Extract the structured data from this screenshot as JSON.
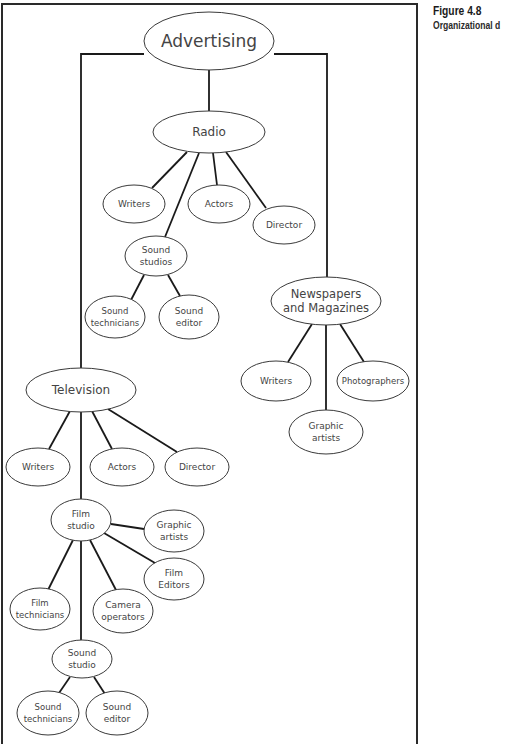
{
  "caption": {
    "title": "Figure 4.8",
    "subtitle": "Organizational d"
  },
  "diagram": {
    "frame": {
      "left": 2,
      "top": 4,
      "right": 417,
      "bottom": 744
    },
    "nodes": [
      {
        "id": "advertising",
        "lines": [
          "Advertising"
        ],
        "cx": 209,
        "cy": 41,
        "rx": 65,
        "ry": 29,
        "fs": 17
      },
      {
        "id": "radio",
        "lines": [
          "Radio"
        ],
        "cx": 209,
        "cy": 132,
        "rx": 56,
        "ry": 21,
        "fs": 12
      },
      {
        "id": "radio-writers",
        "lines": [
          "Writers"
        ],
        "cx": 134,
        "cy": 204,
        "rx": 31,
        "ry": 19,
        "fs": 9
      },
      {
        "id": "radio-actors",
        "lines": [
          "Actors"
        ],
        "cx": 219,
        "cy": 204,
        "rx": 31,
        "ry": 19,
        "fs": 9
      },
      {
        "id": "radio-director",
        "lines": [
          "Director"
        ],
        "cx": 284,
        "cy": 225,
        "rx": 31,
        "ry": 19,
        "fs": 9
      },
      {
        "id": "radio-sound-studios",
        "lines": [
          "Sound",
          "studios"
        ],
        "cx": 156,
        "cy": 256,
        "rx": 31,
        "ry": 20,
        "fs": 9
      },
      {
        "id": "radio-sound-technicians",
        "lines": [
          "Sound",
          "technicians"
        ],
        "cx": 115,
        "cy": 317,
        "rx": 30,
        "ry": 21,
        "fs": 8.5
      },
      {
        "id": "radio-sound-editor",
        "lines": [
          "Sound",
          "editor"
        ],
        "cx": 189,
        "cy": 317,
        "rx": 30,
        "ry": 22,
        "fs": 9
      },
      {
        "id": "newspapers",
        "lines": [
          "Newspapers",
          "and Magazines"
        ],
        "cx": 326,
        "cy": 301,
        "rx": 55,
        "ry": 24,
        "fs": 11.5
      },
      {
        "id": "news-writers",
        "lines": [
          "Writers"
        ],
        "cx": 276,
        "cy": 381,
        "rx": 35,
        "ry": 20,
        "fs": 9
      },
      {
        "id": "news-photographers",
        "lines": [
          "Photographers"
        ],
        "cx": 373,
        "cy": 381,
        "rx": 36,
        "ry": 20,
        "fs": 8.5
      },
      {
        "id": "news-graphic-artists",
        "lines": [
          "Graphic",
          "artists"
        ],
        "cx": 326,
        "cy": 432,
        "rx": 37,
        "ry": 22,
        "fs": 9
      },
      {
        "id": "television",
        "lines": [
          "Television"
        ],
        "cx": 81,
        "cy": 390,
        "rx": 55,
        "ry": 22,
        "fs": 12
      },
      {
        "id": "tv-writers",
        "lines": [
          "Writers"
        ],
        "cx": 38,
        "cy": 467,
        "rx": 32,
        "ry": 19,
        "fs": 9
      },
      {
        "id": "tv-actors",
        "lines": [
          "Actors"
        ],
        "cx": 122,
        "cy": 467,
        "rx": 32,
        "ry": 19,
        "fs": 9
      },
      {
        "id": "tv-director",
        "lines": [
          "Director"
        ],
        "cx": 197,
        "cy": 467,
        "rx": 32,
        "ry": 19,
        "fs": 9
      },
      {
        "id": "film-studio",
        "lines": [
          "Film",
          "studio"
        ],
        "cx": 81,
        "cy": 520,
        "rx": 30,
        "ry": 21,
        "fs": 9
      },
      {
        "id": "film-graphic-artists",
        "lines": [
          "Graphic",
          "artists"
        ],
        "cx": 174,
        "cy": 531,
        "rx": 30,
        "ry": 21,
        "fs": 9
      },
      {
        "id": "film-editors",
        "lines": [
          "Film",
          "Editors"
        ],
        "cx": 174,
        "cy": 579,
        "rx": 30,
        "ry": 21,
        "fs": 9
      },
      {
        "id": "film-technicians",
        "lines": [
          "Film",
          "technicians"
        ],
        "cx": 40,
        "cy": 609,
        "rx": 30,
        "ry": 21,
        "fs": 8.5
      },
      {
        "id": "camera-operators",
        "lines": [
          "Camera",
          "operators"
        ],
        "cx": 123,
        "cy": 611,
        "rx": 30,
        "ry": 22,
        "fs": 9
      },
      {
        "id": "tv-sound-studio",
        "lines": [
          "Sound",
          "studio"
        ],
        "cx": 82,
        "cy": 659,
        "rx": 30,
        "ry": 19,
        "fs": 9
      },
      {
        "id": "tv-sound-technicians",
        "lines": [
          "Sound",
          "technicians"
        ],
        "cx": 48,
        "cy": 713,
        "rx": 31,
        "ry": 22,
        "fs": 8.5
      },
      {
        "id": "tv-sound-editor",
        "lines": [
          "Sound",
          "editor"
        ],
        "cx": 117,
        "cy": 713,
        "rx": 31,
        "ry": 22,
        "fs": 9
      }
    ],
    "edges": [
      {
        "from": "advertising",
        "to": "radio",
        "points": [
          [
            209,
            70
          ],
          [
            209,
            111
          ]
        ]
      },
      {
        "from": "advertising",
        "to": "television",
        "points": [
          [
            144,
            54
          ],
          [
            81,
            54
          ],
          [
            81,
            368
          ]
        ]
      },
      {
        "from": "advertising",
        "to": "newspapers",
        "points": [
          [
            274,
            54
          ],
          [
            327,
            54
          ],
          [
            327,
            277
          ]
        ]
      },
      {
        "from": "radio",
        "to": "radio-writers",
        "points": [
          [
            187,
            152
          ],
          [
            152,
            188
          ]
        ]
      },
      {
        "from": "radio",
        "to": "radio-sound-studios",
        "points": [
          [
            199,
            153
          ],
          [
            165,
            237
          ]
        ]
      },
      {
        "from": "radio",
        "to": "radio-actors",
        "points": [
          [
            213,
            153
          ],
          [
            217,
            185
          ]
        ]
      },
      {
        "from": "radio",
        "to": "radio-director",
        "points": [
          [
            226,
            152
          ],
          [
            266,
            208
          ]
        ]
      },
      {
        "from": "radio-sound-studios",
        "to": "radio-sound-technicians",
        "points": [
          [
            144,
            275
          ],
          [
            131,
            300
          ]
        ]
      },
      {
        "from": "radio-sound-studios",
        "to": "radio-sound-editor",
        "points": [
          [
            168,
            275
          ],
          [
            180,
            296
          ]
        ]
      },
      {
        "from": "newspapers",
        "to": "news-writers",
        "points": [
          [
            312,
            324
          ],
          [
            288,
            362
          ]
        ]
      },
      {
        "from": "newspapers",
        "to": "news-graphic-artists",
        "points": [
          [
            326,
            325
          ],
          [
            326,
            410
          ]
        ]
      },
      {
        "from": "newspapers",
        "to": "news-photographers",
        "points": [
          [
            340,
            324
          ],
          [
            364,
            362
          ]
        ]
      },
      {
        "from": "television",
        "to": "tv-writers",
        "points": [
          [
            70,
            411
          ],
          [
            49,
            449
          ]
        ]
      },
      {
        "from": "television",
        "to": "film-studio",
        "points": [
          [
            81,
            412
          ],
          [
            81,
            499
          ]
        ]
      },
      {
        "from": "television",
        "to": "tv-actors",
        "points": [
          [
            92,
            411
          ],
          [
            112,
            449
          ]
        ]
      },
      {
        "from": "television",
        "to": "tv-director",
        "points": [
          [
            108,
            409
          ],
          [
            177,
            452
          ]
        ]
      },
      {
        "from": "film-studio",
        "to": "film-graphic-artists",
        "points": [
          [
            111,
            524
          ],
          [
            144,
            529
          ]
        ]
      },
      {
        "from": "film-studio",
        "to": "film-editors",
        "points": [
          [
            104,
            533
          ],
          [
            155,
            563
          ]
        ]
      },
      {
        "from": "film-studio",
        "to": "film-technicians",
        "points": [
          [
            73,
            540
          ],
          [
            48,
            590
          ]
        ]
      },
      {
        "from": "film-studio",
        "to": "camera-operators",
        "points": [
          [
            90,
            540
          ],
          [
            116,
            590
          ]
        ]
      },
      {
        "from": "film-studio",
        "to": "tv-sound-studio",
        "points": [
          [
            81,
            541
          ],
          [
            81,
            640
          ]
        ]
      },
      {
        "from": "tv-sound-studio",
        "to": "tv-sound-technicians",
        "points": [
          [
            70,
            677
          ],
          [
            59,
            693
          ]
        ]
      },
      {
        "from": "tv-sound-studio",
        "to": "tv-sound-editor",
        "points": [
          [
            94,
            677
          ],
          [
            105,
            694
          ]
        ]
      }
    ]
  }
}
